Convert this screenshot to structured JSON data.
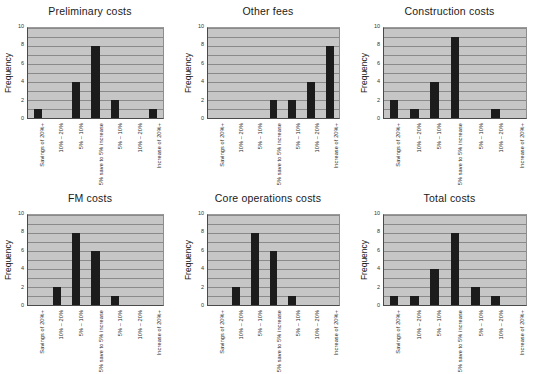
{
  "figure": {
    "categories": [
      "Savings of 20%+",
      "10% – 20%",
      "5% – 10%",
      "5% save to 5% increase",
      "5% – 10%",
      "10% – 20%",
      "Increase of 20%+"
    ],
    "ylabel": "Frequency",
    "yticks": [
      "0",
      "2",
      "4",
      "6",
      "8",
      "10"
    ],
    "ylim": [
      0,
      10
    ],
    "bar_color": "#1c1c1c",
    "plot_bg_color": "#c6c6c6",
    "gridline_color": "#8a8a8a"
  },
  "chart_data": [
    {
      "type": "bar",
      "title": "Preliminary costs",
      "categories": [
        "Savings of 20%+",
        "10% – 20%",
        "5% – 10%",
        "5% save to 5% increase",
        "5% – 10%",
        "10% – 20%",
        "Increase of 20%+"
      ],
      "values": [
        1,
        0,
        4,
        8,
        2,
        0,
        1
      ],
      "xlabel": "",
      "ylabel": "Frequency",
      "ylim": [
        0,
        10
      ],
      "grid": true,
      "legend": "none"
    },
    {
      "type": "bar",
      "title": "Other fees",
      "categories": [
        "Savings of 20%+",
        "10% – 20%",
        "5% – 10%",
        "5% save to 5% increase",
        "5% – 10%",
        "10% – 20%",
        "Increase of 20%+"
      ],
      "values": [
        0,
        0,
        0,
        2,
        2,
        4,
        8
      ],
      "xlabel": "",
      "ylabel": "Frequency",
      "ylim": [
        0,
        10
      ],
      "grid": true,
      "legend": "none"
    },
    {
      "type": "bar",
      "title": "Construction costs",
      "categories": [
        "Savings of 20%+",
        "10% – 20%",
        "5% – 10%",
        "5% save to 5% increase",
        "5% – 10%",
        "10% – 20%",
        "Increase of 20%+"
      ],
      "values": [
        2,
        1,
        4,
        9,
        0,
        1,
        0
      ],
      "xlabel": "",
      "ylabel": "Frequency",
      "ylim": [
        0,
        10
      ],
      "grid": true,
      "legend": "none"
    },
    {
      "type": "bar",
      "title": "FM costs",
      "categories": [
        "Savings of 20%+",
        "10% – 20%",
        "5% – 10%",
        "5% save to 5% increase",
        "5% – 10%",
        "10% – 20%",
        "Increase of 20%+"
      ],
      "values": [
        0,
        2,
        8,
        6,
        1,
        0,
        0
      ],
      "xlabel": "",
      "ylabel": "Frequency",
      "ylim": [
        0,
        10
      ],
      "grid": true,
      "legend": "none"
    },
    {
      "type": "bar",
      "title": "Core operations costs",
      "categories": [
        "Savings of 20%+",
        "10% – 20%",
        "5% – 10%",
        "5% save to 5% increase",
        "5% – 10%",
        "10% – 20%",
        "Increase of 20%+"
      ],
      "values": [
        0,
        2,
        8,
        6,
        1,
        0,
        0
      ],
      "xlabel": "",
      "ylabel": "Frequency",
      "ylim": [
        0,
        10
      ],
      "grid": true,
      "legend": "none"
    },
    {
      "type": "bar",
      "title": "Total costs",
      "categories": [
        "Savings of 20%+",
        "10% – 20%",
        "5% – 10%",
        "5% save to 5% increase",
        "5% – 10%",
        "10% – 20%",
        "Increase of 20%+"
      ],
      "values": [
        1,
        1,
        4,
        8,
        2,
        1,
        0
      ],
      "xlabel": "",
      "ylabel": "Frequency",
      "ylim": [
        0,
        10
      ],
      "grid": true,
      "legend": "none"
    }
  ]
}
